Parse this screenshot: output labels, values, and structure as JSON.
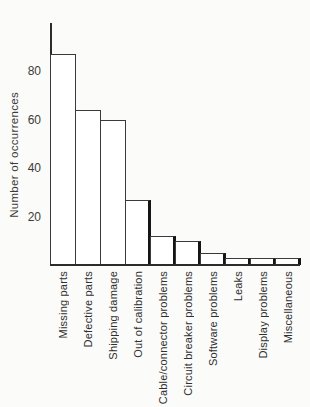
{
  "figure": {
    "background": "#fbfbf9",
    "ink": "#333333"
  },
  "chart_data": {
    "type": "bar",
    "title": "",
    "xlabel": "",
    "ylabel": "Number of occurrences",
    "categories": [
      "Missing parts",
      "Defective parts",
      "Shipping damage",
      "Out of calibration",
      "Cable/connector problems",
      "Circuit breaker problems",
      "Software problems",
      "Leaks",
      "Display problems",
      "Miscellaneous"
    ],
    "values": [
      87,
      64,
      60,
      27,
      12,
      10,
      5,
      3,
      3,
      3
    ],
    "ylim": [
      0,
      100
    ],
    "yticks": [
      20,
      40,
      60,
      80
    ],
    "grid": false,
    "legend": false,
    "orientation": "vertical",
    "bar_fill": "#ffffff",
    "bar_outline": "#3a3a3a"
  }
}
